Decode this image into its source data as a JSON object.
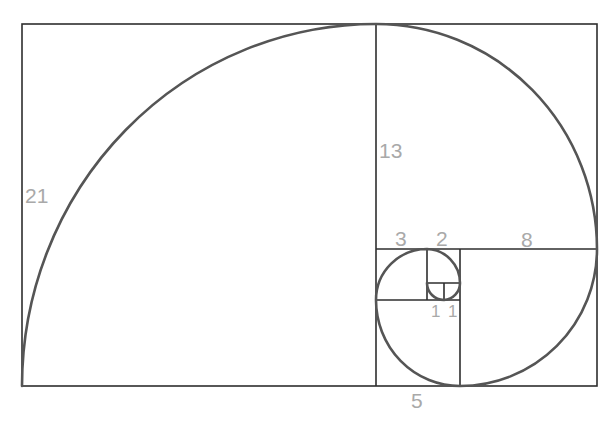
{
  "colors": {
    "grid_lines": "#2e2e2e",
    "spiral": "#555555",
    "labels": "#a9a9a9",
    "background": "#ffffff"
  },
  "squares": [
    {
      "side": 21,
      "label": "21"
    },
    {
      "side": 13,
      "label": "13"
    },
    {
      "side": 8,
      "label": "8"
    },
    {
      "side": 5,
      "label": "5"
    },
    {
      "side": 3,
      "label": "3"
    },
    {
      "side": 2,
      "label": "2"
    },
    {
      "side": 1,
      "label": "1"
    },
    {
      "side": 1,
      "label": "1"
    }
  ],
  "labels": {
    "sq21": "21",
    "sq13": "13",
    "sq8": "8",
    "sq5": "5",
    "sq3": "3",
    "sq2": "2",
    "sq1a": "1",
    "sq1b": "1"
  }
}
